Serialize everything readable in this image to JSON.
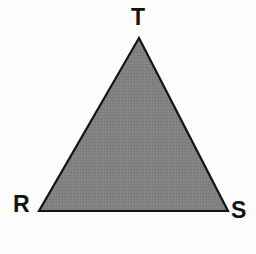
{
  "figure": {
    "name": "triangle-rst",
    "background_color": "#fdfdfd",
    "shape": {
      "type": "triangle",
      "fill_color": "#808080",
      "stroke_color": "#141414",
      "stroke_width": 2.2,
      "fill_texture": "halftone-dither",
      "vertices": [
        {
          "label": "T",
          "x": 139,
          "y": 38
        },
        {
          "label": "S",
          "x": 228,
          "y": 211
        },
        {
          "label": "R",
          "x": 39,
          "y": 211
        }
      ]
    },
    "labels": {
      "apex": "T",
      "bottom_left": "R",
      "bottom_right": "S"
    }
  }
}
